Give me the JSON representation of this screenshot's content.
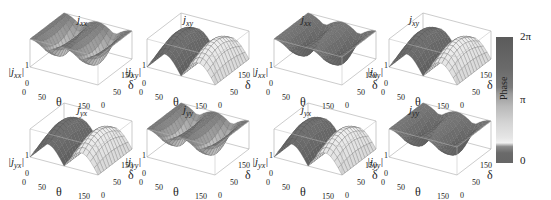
{
  "figure": {
    "panels": [
      {
        "id": "p1",
        "row": 0,
        "col": 0,
        "title_base": "j",
        "title_sub": "xx",
        "zlabel_sub": "xx",
        "shape": "valley",
        "shade": "mixed-light"
      },
      {
        "id": "p2",
        "row": 0,
        "col": 1,
        "title_base": "j",
        "title_sub": "xy",
        "zlabel_sub": "xy",
        "shape": "ridge",
        "shade": "dark-light"
      },
      {
        "id": "p3",
        "row": 0,
        "col": 2,
        "title_base": "j",
        "title_sub": "xx",
        "zlabel_sub": "xx",
        "shape": "valley",
        "shade": "dark"
      },
      {
        "id": "p4",
        "row": 0,
        "col": 3,
        "title_base": "j",
        "title_sub": "xy",
        "zlabel_sub": "xy",
        "shape": "ridge",
        "shade": "dark-light"
      },
      {
        "id": "p5",
        "row": 1,
        "col": 0,
        "title_base": "j",
        "title_sub": "yx",
        "zlabel_sub": "yx",
        "shape": "ridge",
        "shade": "dark-light"
      },
      {
        "id": "p6",
        "row": 1,
        "col": 1,
        "title_base": "j",
        "title_sub": "yy",
        "zlabel_sub": "yy",
        "shape": "valley",
        "shade": "mixed-light"
      },
      {
        "id": "p7",
        "row": 1,
        "col": 2,
        "title_base": "j",
        "title_sub": "yx",
        "zlabel_sub": "yx",
        "shape": "ridge",
        "shade": "dark-light"
      },
      {
        "id": "p8",
        "row": 1,
        "col": 3,
        "title_base": "j",
        "title_sub": "yy",
        "zlabel_sub": "yy",
        "shape": "valley",
        "shade": "dark"
      }
    ],
    "axes": {
      "theta_label": "θ",
      "delta_label": "δ",
      "theta_ticks": [
        "0",
        "50",
        "150"
      ],
      "delta_ticks": [
        "0",
        "50",
        "150"
      ],
      "z_ticks": [
        "0",
        "1"
      ]
    },
    "colorbar": {
      "label": "Phase",
      "ticks": [
        "0",
        "π",
        "2π"
      ]
    }
  },
  "chart_data": {
    "type": "surface3d",
    "grid": {
      "rows": 2,
      "cols": 4
    },
    "subplots": [
      {
        "title": "j_xx",
        "zlabel": "|j_xx|",
        "xlabel": "θ",
        "ylabel": "δ",
        "xlim": [
          0,
          180
        ],
        "ylim": [
          0,
          180
        ],
        "zlim": [
          0,
          1
        ],
        "description": "valley: |j_xx| ≈ 1 at θ=0,180; minimum along θ≈90 depending on δ"
      },
      {
        "title": "j_xy",
        "zlabel": "|j_xy|",
        "xlabel": "θ",
        "ylabel": "δ",
        "xlim": [
          0,
          180
        ],
        "ylim": [
          0,
          180
        ],
        "zlim": [
          0,
          1
        ],
        "description": "ridge: |j_xy| peaks near θ≈45 and θ≈135, zero at θ=0,90,180"
      },
      {
        "title": "j_xx",
        "zlabel": "|j_xx|",
        "xlabel": "θ",
        "ylabel": "δ",
        "xlim": [
          0,
          180
        ],
        "ylim": [
          0,
          180
        ],
        "zlim": [
          0,
          1
        ],
        "description": "valley shape, dark phase coloring"
      },
      {
        "title": "j_xy",
        "zlabel": "|j_xy|",
        "xlabel": "θ",
        "ylabel": "δ",
        "xlim": [
          0,
          180
        ],
        "ylim": [
          0,
          180
        ],
        "zlim": [
          0,
          1
        ],
        "description": "two ridges"
      },
      {
        "title": "j_yx",
        "zlabel": "|j_yx|",
        "xlabel": "θ",
        "ylabel": "δ",
        "xlim": [
          0,
          180
        ],
        "ylim": [
          0,
          180
        ],
        "zlim": [
          0,
          1
        ],
        "description": "two ridges"
      },
      {
        "title": "j_yy",
        "zlabel": "|j_yy|",
        "xlabel": "θ",
        "ylabel": "δ",
        "xlim": [
          0,
          180
        ],
        "ylim": [
          0,
          180
        ],
        "zlim": [
          0,
          1
        ],
        "description": "valley shape"
      },
      {
        "title": "j_yx",
        "zlabel": "|j_yx|",
        "xlabel": "θ",
        "ylabel": "δ",
        "xlim": [
          0,
          180
        ],
        "ylim": [
          0,
          180
        ],
        "zlim": [
          0,
          1
        ],
        "description": "two ridges"
      },
      {
        "title": "j_yy",
        "zlabel": "|j_yy|",
        "xlabel": "θ",
        "ylabel": "δ",
        "xlim": [
          0,
          180
        ],
        "ylim": [
          0,
          180
        ],
        "zlim": [
          0,
          1
        ],
        "description": "valley shape, dark phase coloring"
      }
    ],
    "x_ticks": [
      0,
      50,
      150
    ],
    "y_ticks": [
      0,
      50,
      150
    ],
    "z_ticks": [
      0,
      1
    ],
    "colorbar": {
      "label": "Phase",
      "range": [
        0,
        6.2832
      ],
      "tick_labels": [
        "0",
        "π",
        "2π"
      ],
      "position": "right",
      "colormap": "grayscale"
    }
  }
}
